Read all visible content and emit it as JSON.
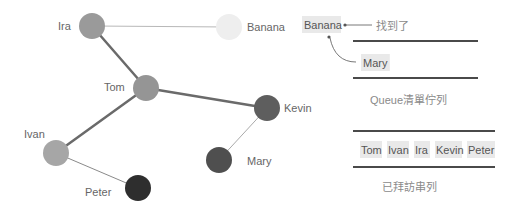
{
  "graph": {
    "nodes": [
      {
        "id": "ira",
        "label": "Ira",
        "x": 92,
        "y": 26,
        "r": 13,
        "color": "#9a9a9a",
        "label_x": 58,
        "label_y": 30,
        "anchor": "start"
      },
      {
        "id": "banana",
        "label": "Banana",
        "x": 229,
        "y": 27,
        "r": 13,
        "color": "#eeeeee",
        "label_x": 247,
        "label_y": 31,
        "anchor": "start"
      },
      {
        "id": "tom",
        "label": "Tom",
        "x": 146,
        "y": 88,
        "r": 13,
        "color": "#959595",
        "label_x": 104,
        "label_y": 91,
        "anchor": "start"
      },
      {
        "id": "kevin",
        "label": "Kevin",
        "x": 267,
        "y": 108,
        "r": 13,
        "color": "#5e5e5e",
        "label_x": 284,
        "label_y": 112,
        "anchor": "start"
      },
      {
        "id": "ivan",
        "label": "Ivan",
        "x": 56,
        "y": 153,
        "r": 13,
        "color": "#a6a6a6",
        "label_x": 24,
        "label_y": 138,
        "anchor": "start"
      },
      {
        "id": "mary",
        "label": "Mary",
        "x": 219,
        "y": 160,
        "r": 13,
        "color": "#4f4f4f",
        "label_x": 247,
        "label_y": 165,
        "anchor": "start"
      },
      {
        "id": "peter",
        "label": "Peter",
        "x": 138,
        "y": 188,
        "r": 13,
        "color": "#2e2e2e",
        "label_x": 85,
        "label_y": 196,
        "anchor": "start"
      }
    ],
    "edges": [
      {
        "from": "ira",
        "to": "banana",
        "width": 1,
        "color": "#b8b8b8"
      },
      {
        "from": "ira",
        "to": "tom",
        "width": 2.5,
        "color": "#6a6a6a"
      },
      {
        "from": "tom",
        "to": "kevin",
        "width": 2.5,
        "color": "#6a6a6a"
      },
      {
        "from": "tom",
        "to": "ivan",
        "width": 2.5,
        "color": "#6a6a6a"
      },
      {
        "from": "kevin",
        "to": "mary",
        "width": 1,
        "color": "#aaaaaa"
      },
      {
        "from": "ivan",
        "to": "peter",
        "width": 1,
        "color": "#8a8a8a"
      }
    ]
  },
  "queue_panel": {
    "found_item": "Banana",
    "found_note": "找到了",
    "queue_items": [
      "Mary"
    ],
    "queue_caption": "Queue清單佇列"
  },
  "visited_panel": {
    "items": [
      "Tom",
      "Ivan",
      "Ira",
      "Kevin",
      "Peter"
    ],
    "caption": "已拜訪串列"
  },
  "colors": {
    "rule": "#4a4a4a",
    "chip_bg": "#e9e9e9",
    "arrow": "#555555"
  }
}
